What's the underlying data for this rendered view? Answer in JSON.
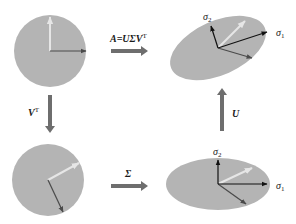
{
  "diagram": {
    "colors": {
      "shape_fill": "#b4b4b4",
      "light_vector": "#e6e6e6",
      "dark_vector": "#4a4a4a",
      "axis_vector": "#111111",
      "transform_arrow": "#6e6e6e",
      "text": "#1a1a1a"
    },
    "panels": [
      {
        "id": "unit-circle",
        "shape": "circle",
        "position": "top-left"
      },
      {
        "id": "transformed-ellipse",
        "shape": "ellipse-rotated",
        "position": "top-right",
        "axis_labels": [
          "σ",
          "σ"
        ],
        "axis_subscripts": [
          "2",
          "1"
        ]
      },
      {
        "id": "rotated-circle",
        "shape": "circle",
        "position": "bottom-left"
      },
      {
        "id": "scaled-ellipse",
        "shape": "ellipse",
        "position": "bottom-right",
        "axis_labels": [
          "σ",
          "σ"
        ],
        "axis_subscripts": [
          "2",
          "1"
        ]
      }
    ],
    "transforms": [
      {
        "id": "A",
        "label_main": "A=UΣV",
        "label_sup": "T",
        "direction": "right",
        "from": "top-left",
        "to": "top-right"
      },
      {
        "id": "Vt",
        "label_main": "V",
        "label_sup": "T",
        "direction": "down",
        "from": "top-left",
        "to": "bottom-left"
      },
      {
        "id": "Sigma",
        "label_main": "Σ",
        "label_sup": "",
        "direction": "right",
        "from": "bottom-left",
        "to": "bottom-right"
      },
      {
        "id": "U",
        "label_main": "U",
        "label_sup": "",
        "direction": "up",
        "from": "bottom-right",
        "to": "top-right"
      }
    ]
  }
}
